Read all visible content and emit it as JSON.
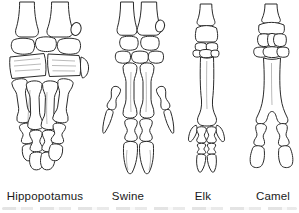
{
  "figure": {
    "items": [
      {
        "label": "Hippopotamus",
        "illustration": "hippopotamus-foot-bones"
      },
      {
        "label": "Swine",
        "illustration": "swine-foot-bones"
      },
      {
        "label": "Elk",
        "illustration": "elk-foot-bones"
      },
      {
        "label": "Camel",
        "illustration": "camel-foot-bones"
      }
    ],
    "colors": {
      "background": "#ffffff",
      "ink": "#2a2a2a",
      "label_text": "#1a1a1a"
    }
  }
}
